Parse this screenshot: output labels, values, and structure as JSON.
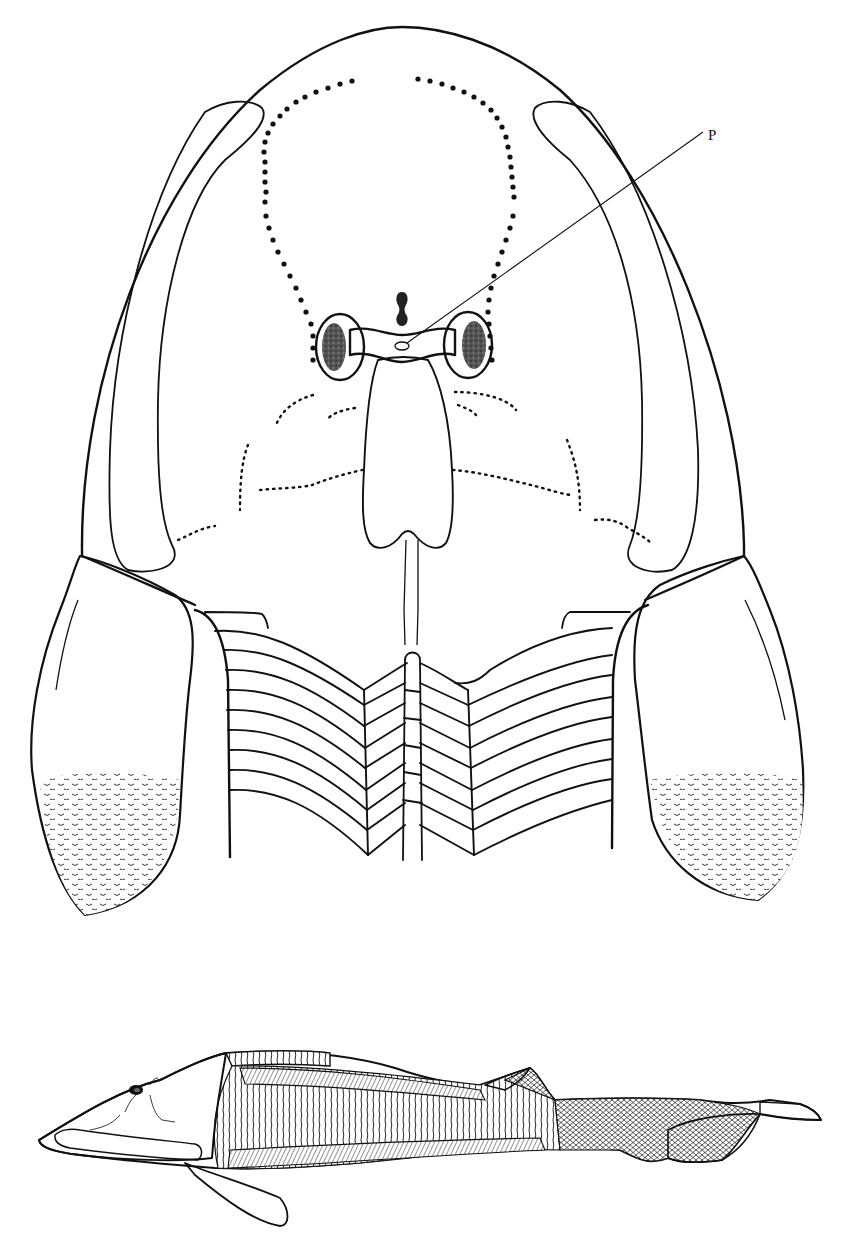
{
  "figure": {
    "clipped_caption_text": "",
    "top_view": {
      "description": "Dorsal view of head shield with pectoral fins and anterior trunk",
      "labels": [
        {
          "id": "P",
          "text": "P",
          "x": 708,
          "y": 140,
          "points_to": "pineal-opening"
        }
      ],
      "colors": {
        "ink": "#111111",
        "paper": "#ffffff",
        "eye_fill": "#333333"
      }
    },
    "side_view": {
      "description": "Lateral view reconstruction of the whole fish"
    }
  }
}
